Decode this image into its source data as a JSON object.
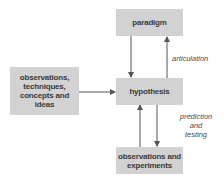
{
  "diagram": {
    "nodes": {
      "paradigm": {
        "label": "paradigm"
      },
      "sources": {
        "lines": [
          "observations,",
          "techniques,",
          "concepts and",
          "ideas"
        ]
      },
      "hypothesis": {
        "label": "hypothesis"
      },
      "experiments": {
        "lines": [
          "observations and",
          "experiments"
        ]
      }
    },
    "edge_labels": {
      "articulation": "articulation",
      "prediction": [
        "prediction",
        "and",
        "testing"
      ]
    },
    "edges": [
      {
        "from": "paradigm",
        "to": "hypothesis"
      },
      {
        "from": "hypothesis",
        "to": "paradigm",
        "label": "articulation"
      },
      {
        "from": "sources",
        "to": "hypothesis"
      },
      {
        "from": "experiments",
        "to": "hypothesis"
      },
      {
        "from": "hypothesis",
        "to": "experiments",
        "label": "prediction and testing"
      }
    ],
    "colors": {
      "box_fill": "#d2d2d2",
      "text": "#3a3a3a",
      "arrow": "#555555"
    }
  }
}
